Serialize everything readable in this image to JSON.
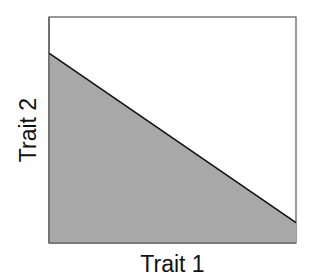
{
  "chart_data": {
    "type": "area",
    "title": "",
    "xlabel": "Trait 1",
    "ylabel": "Trait 2",
    "x": [
      0,
      1
    ],
    "series": [
      {
        "name": "feasible region",
        "values": [
          0.84,
          0.09
        ],
        "fill": "#a8a8a8",
        "line": "#111111"
      }
    ],
    "xlim": [
      0,
      1
    ],
    "ylim": [
      0,
      1
    ],
    "grid": false,
    "ticks": false,
    "legend": null,
    "annotations": []
  },
  "colors": {
    "fill": "#a8a8a8",
    "line": "#111111",
    "frame": "#555555"
  }
}
